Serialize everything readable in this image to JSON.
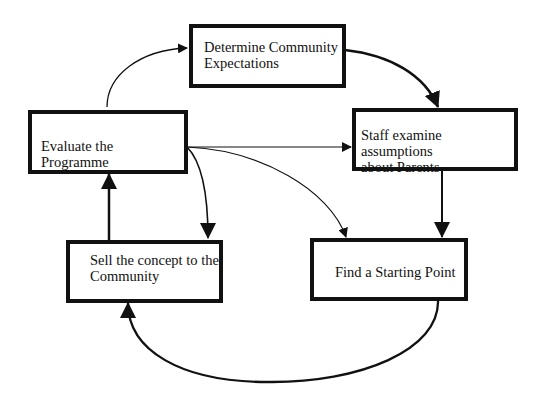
{
  "diagram": {
    "type": "cycle-flowchart",
    "nodes": [
      {
        "id": "determine",
        "label": "Determine Community\nExpectations"
      },
      {
        "id": "staff",
        "label": "Staff examine assumptions\nabout Parents"
      },
      {
        "id": "evaluate",
        "label": "Evaluate the Programme"
      },
      {
        "id": "sell",
        "label": "Sell the concept to the\nCommunity"
      },
      {
        "id": "find",
        "label": "Find a Starting Point"
      }
    ],
    "edges": [
      {
        "from": "evaluate",
        "to": "determine",
        "style": "thin-curve"
      },
      {
        "from": "determine",
        "to": "staff",
        "style": "thick-curve"
      },
      {
        "from": "evaluate",
        "to": "staff",
        "style": "thin-straight"
      },
      {
        "from": "evaluate",
        "to": "sell",
        "style": "medium-curve"
      },
      {
        "from": "evaluate",
        "to": "find",
        "style": "thin-curve"
      },
      {
        "from": "staff",
        "to": "find",
        "style": "thick-straight"
      },
      {
        "from": "sell",
        "to": "evaluate",
        "style": "thick-straight"
      },
      {
        "from": "find",
        "to": "sell",
        "style": "thick-arc"
      }
    ]
  }
}
